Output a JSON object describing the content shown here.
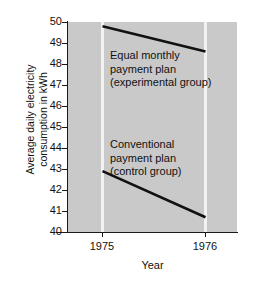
{
  "chart_data": {
    "type": "line",
    "title": "",
    "xlabel": "Year",
    "ylabel": "Average daily electricity consumption in kWh",
    "ylabel_lines": [
      "Average daily electricity",
      "consumption in kWh"
    ],
    "x": [
      "1975",
      "1976"
    ],
    "xlim": [
      1974.66,
      1976.32
    ],
    "ylim": [
      40,
      50
    ],
    "yticks": [
      50,
      49,
      48,
      47,
      46,
      45,
      44,
      43,
      42,
      41,
      40
    ],
    "ytick_labels": [
      "50",
      "49",
      "48",
      "47",
      "46",
      "45",
      "44",
      "43",
      "42",
      "41",
      "40"
    ],
    "xticks": [
      "1975",
      "1976"
    ],
    "grid": "vertical-only",
    "legend": "none",
    "series": [
      {
        "name": "Equal monthly payment plan (experimental group)",
        "values": [
          49.8,
          48.6
        ]
      },
      {
        "name": "Conventional payment plan (control group)",
        "values": [
          42.9,
          40.7
        ]
      }
    ],
    "annotations": [
      {
        "lines": [
          "Equal monthly",
          "payment plan",
          "(experimental group)"
        ],
        "series": "Equal monthly payment plan (experimental group)"
      },
      {
        "lines": [
          "Conventional",
          "payment plan",
          "(control group)"
        ],
        "series": "Conventional payment plan (control group)"
      }
    ],
    "colors": {
      "plot_background": "#c9c9c9",
      "figure_background": "#ffffff",
      "gridline": "#f2f2f2",
      "line": "#111111",
      "axis": "#1a1a1a",
      "text": "#111111"
    }
  }
}
